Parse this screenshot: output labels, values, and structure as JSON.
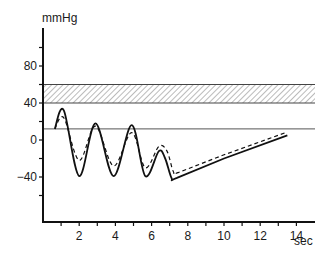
{
  "chart_data": {
    "type": "line",
    "title": "",
    "ylabel": "mmHg",
    "xlabel": "sec",
    "ylim": [
      -80,
      110
    ],
    "xlim": [
      0,
      15
    ],
    "y_ticks": [
      -60,
      -40,
      -20,
      0,
      20,
      40,
      60,
      80,
      100
    ],
    "y_tick_labels": [
      {
        "value": 80,
        "label": "80"
      },
      {
        "value": 40,
        "label": "40"
      },
      {
        "value": 0,
        "label": "0"
      },
      {
        "value": -40,
        "label": "-40"
      }
    ],
    "x_ticks": [
      1,
      2,
      3,
      4,
      5,
      6,
      7,
      8,
      9,
      10,
      11,
      12,
      13,
      14
    ],
    "x_tick_labels": [
      {
        "value": 2,
        "label": "2"
      },
      {
        "value": 4,
        "label": "4"
      },
      {
        "value": 6,
        "label": "6"
      },
      {
        "value": 8,
        "label": "8"
      },
      {
        "value": 10,
        "label": "10"
      },
      {
        "value": 12,
        "label": "12"
      },
      {
        "value": 14,
        "label": "14"
      }
    ],
    "grid": false,
    "legend": null,
    "annotations": [
      {
        "type": "hatched_band",
        "y_from": 40,
        "y_to": 60,
        "x_from": 0,
        "x_to": 15
      },
      {
        "type": "reference_line",
        "y": 12,
        "x_from": 0,
        "x_to": 15
      }
    ],
    "series": [
      {
        "name": "solid",
        "style": "solid",
        "x": [
          0.65,
          1.15,
          2.0,
          2.9,
          3.9,
          4.9,
          5.65,
          6.4,
          6.75,
          7.1,
          7.4,
          10.0,
          13.5
        ],
        "y": [
          12,
          32,
          -39,
          18,
          -39,
          16,
          -39,
          -12,
          -20,
          -41,
          -41,
          -20,
          5
        ]
      },
      {
        "name": "dashed",
        "style": "dashed",
        "x": [
          0.65,
          1.15,
          2.0,
          2.9,
          3.9,
          4.9,
          5.65,
          6.4,
          6.85,
          7.2,
          7.5,
          10.0,
          13.4
        ],
        "y": [
          12,
          24,
          -22,
          15,
          -28,
          8,
          -30,
          -7,
          -12,
          -34,
          -35,
          -16,
          8
        ]
      }
    ]
  },
  "labels": {
    "y_unit": "mmHg",
    "x_unit": "sec"
  }
}
